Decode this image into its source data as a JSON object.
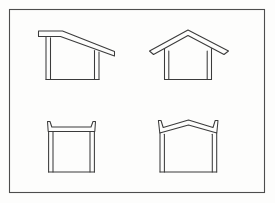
{
  "figure": {
    "title": "Roof profile line drawings",
    "background_color": "#fdfdfc",
    "ink_color": "#3b3b3b",
    "frame_color": "#4d4d4d",
    "frame": {
      "x": 9,
      "y": 9,
      "width": 256,
      "height": 184
    },
    "panel_count": 4,
    "panels": [
      {
        "id": "shed-roof",
        "position": "top-left",
        "label": "Shed roof with single slope and eave overhang",
        "roof_type": "mono-pitch",
        "has_overhang": true,
        "slope_direction": "down-to-right"
      },
      {
        "id": "gable-roof",
        "position": "top-right",
        "label": "Gable roof with symmetric pitch and eave overhangs",
        "roof_type": "gable",
        "has_overhang": true,
        "slope_direction": "symmetric"
      },
      {
        "id": "flat-roof-parapet",
        "position": "bottom-left",
        "label": "Flat roof with upturned parapet ends",
        "roof_type": "flat",
        "has_overhang": false,
        "slope_direction": "level"
      },
      {
        "id": "flared-gable-roof",
        "position": "bottom-right",
        "label": "Shallow gable roof with upturned flared eaves",
        "roof_type": "flared-gable",
        "has_overhang": true,
        "slope_direction": "symmetric"
      }
    ]
  }
}
